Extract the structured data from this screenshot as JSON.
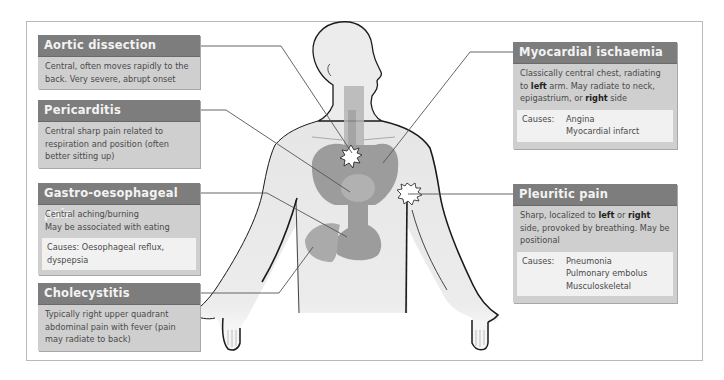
{
  "diagram": {
    "type": "anatomical-callout-diagram"
  },
  "boxes": {
    "aortic": {
      "title": "Aortic dissection",
      "text": "Central, often moves rapidly to the back. Very severe, abrupt onset"
    },
    "pericarditis": {
      "title": "Pericarditis",
      "text": "Central sharp pain related to respiration and position (often better sitting up)"
    },
    "gastro": {
      "title": "Gastro-oesophageal pain",
      "line1": "Central aching/burning",
      "line2": "May be associated with eating",
      "causes": "Causes: Oesophageal reflux, dyspepsia"
    },
    "chole": {
      "title": "Cholecystitis",
      "text": "Typically right upper quadrant abdominal pain with fever (pain may radiate to back)"
    },
    "myocardial": {
      "title": "Myocardial ischaemia",
      "text_a": "Classically central chest, radiating to ",
      "bold_a": "left",
      "text_b": " arm. May radiate to neck, epigastrium, or ",
      "bold_b": "right",
      "text_c": " side",
      "causes_label": "Causes:",
      "causes": [
        "Angina",
        "Myocardial infarct"
      ]
    },
    "pleuritic": {
      "title": "Pleuritic pain",
      "text_a": "Sharp, localized to ",
      "bold_a": "left",
      "text_b": " or ",
      "bold_b": "right",
      "text_c": " side, provoked by breathing. May be positional",
      "causes_label": "Causes:",
      "causes": [
        "Pneumonia",
        "Pulmonary embolus",
        "Musculoskeletal"
      ]
    }
  },
  "colors": {
    "header_bg": "#7d7d7d",
    "body_bg": "#cfcfcf",
    "causes_bg": "#f1f1f1",
    "skin": "#ececec",
    "organ": "#8f8f8f",
    "outline": "#1a1a1a",
    "leader_line": "#555555"
  }
}
